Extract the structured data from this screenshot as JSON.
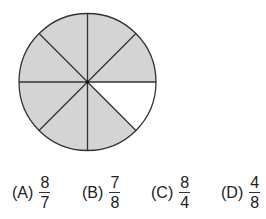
{
  "figure": {
    "type": "fraction-circle",
    "total_slices": 8,
    "shaded_slices": 7,
    "unshaded_slice_index": 0,
    "shade_color": "#d4d4d4",
    "line_color": "#333333"
  },
  "choices": [
    {
      "label": "(A)",
      "numerator": "8",
      "denominator": "7"
    },
    {
      "label": "(B)",
      "numerator": "7",
      "denominator": "8"
    },
    {
      "label": "(C)",
      "numerator": "8",
      "denominator": "4"
    },
    {
      "label": "(D)",
      "numerator": "4",
      "denominator": "8"
    }
  ]
}
